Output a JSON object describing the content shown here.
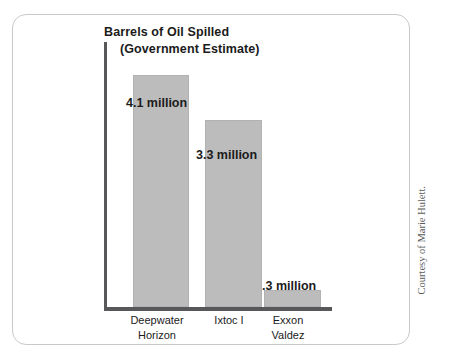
{
  "figure": {
    "credit": "Courtesy of Marie Hulett."
  },
  "chart_data": {
    "type": "bar",
    "title": "Barrels of Oil Spilled",
    "subtitle": "(Government Estimate)",
    "title_line1": "Barrels of Oil Spilled",
    "title_line2": "(Government Estimate)",
    "xlabel": "",
    "ylabel": "",
    "categories": [
      "Deepwater\nHorizon",
      "Ixtoc I",
      "Exxon\nValdez"
    ],
    "values": [
      4.1,
      3.3,
      0.3
    ],
    "value_labels": [
      "4.1 million",
      "3.3 million",
      ".3 million"
    ],
    "unit": "million barrels",
    "ylim": [
      0,
      4.6
    ],
    "grid": false,
    "legend": "none",
    "bar_color": "#bcbcbc",
    "bar_border_color": "#b2b2b2",
    "axis_color": "#58585a",
    "text_color": "#1b1b1b"
  }
}
